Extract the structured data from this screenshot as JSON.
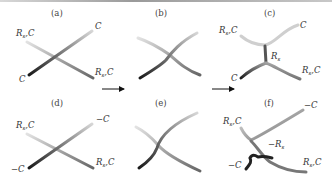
{
  "figure": {
    "panels": [
      {
        "id": "a",
        "label": "(a)",
        "labels": [
          "R,C",
          "C",
          "C",
          "R,C"
        ]
      },
      {
        "id": "b",
        "label": "(b)",
        "labels": []
      },
      {
        "id": "c",
        "label": "(c)",
        "labels": [
          "R,C",
          "C",
          "R",
          "C",
          "R,C"
        ]
      },
      {
        "id": "d",
        "label": "(d)",
        "labels": [
          "R,C",
          "−C",
          "−C",
          "R,C"
        ]
      },
      {
        "id": "e",
        "label": "(e)",
        "labels": []
      },
      {
        "id": "f",
        "label": "(f)",
        "labels": [
          "R,C",
          "−C",
          "−R",
          "−C",
          "R,C"
        ]
      }
    ],
    "arrows": [
      "a-to-b",
      "b-to-c",
      "d-to-e",
      "e-to-f"
    ],
    "text": {
      "R": "R",
      "C": "C",
      "RC": "R,C",
      "negC": "−C",
      "negR": "−R",
      "sub_s": "s",
      "comma_c": ",C"
    }
  }
}
